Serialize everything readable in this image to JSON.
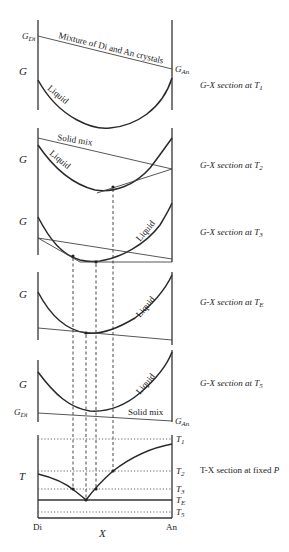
{
  "figure": {
    "x_axis_label": "X",
    "end_members": {
      "left": "Di",
      "right": "An"
    },
    "g_axis_label": "G",
    "t_axis_label": "T"
  },
  "panels": [
    {
      "id": "T1",
      "caption_prefix": "G-X section at ",
      "caption_var": "T",
      "caption_sub": "1",
      "left_end_label": "G",
      "left_end_sub": "Di",
      "right_end_label": "G",
      "right_end_sub": "An",
      "solid_line_label": "Mixture of Di and An crystals",
      "curve_label": "Liquid"
    },
    {
      "id": "T2",
      "caption_prefix": "G-X section at ",
      "caption_var": "T",
      "caption_sub": "2",
      "solid_line_label": "Solid mix",
      "curve_label": "Liquid"
    },
    {
      "id": "T3",
      "caption_prefix": "G-X section at ",
      "caption_var": "T",
      "caption_sub": "3",
      "curve_label": "Liquid"
    },
    {
      "id": "TE",
      "caption_prefix": "G-X section at ",
      "caption_var": "T",
      "caption_sub": "E",
      "curve_label": "Liquid"
    },
    {
      "id": "T5",
      "caption_prefix": "G-X section at ",
      "caption_var": "T",
      "caption_sub": "5",
      "left_end_label": "G",
      "left_end_sub": "Di",
      "right_end_label": "G",
      "right_end_sub": "An",
      "solid_line_label": "Solid mix",
      "curve_label": "Liquid"
    }
  ],
  "tx_section": {
    "caption_prefix": "T-X section at fixed ",
    "caption_var": "P",
    "temperature_levels": [
      {
        "var": "T",
        "sub": "1"
      },
      {
        "var": "T",
        "sub": "2"
      },
      {
        "var": "T",
        "sub": "3"
      },
      {
        "var": "T",
        "sub": "E"
      },
      {
        "var": "T",
        "sub": "5"
      }
    ]
  }
}
